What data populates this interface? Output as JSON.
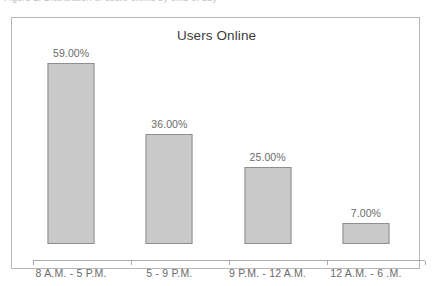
{
  "caption": {
    "text": "Figure 2. Distribution of users online by time of day"
  },
  "chart_data": {
    "type": "bar",
    "title": "Users Online",
    "xlabel": "",
    "ylabel": "",
    "categories": [
      "8 A.M. - 5 P.M.",
      "5 - 9 P.M.",
      "9 P.M. - 12 A.M.",
      "12 A.M. - 6 .M."
    ],
    "values": [
      59.0,
      36.0,
      25.0,
      7.0
    ],
    "value_labels": [
      "59.00%",
      "36.00%",
      "25.00%",
      "7.00%"
    ],
    "unit": "%",
    "ylim": [
      0,
      64
    ],
    "grid": false,
    "legend": "none",
    "series": [
      {
        "name": "Users Online",
        "values": [
          59.0,
          36.0,
          25.0,
          7.0
        ]
      }
    ],
    "style": {
      "bar_fill": "#c9c9c9",
      "bar_border": "#8e8e8e",
      "axis_color": "#a9a9a9",
      "frame_color": "#b6b6b6",
      "title_color": "#3b3b3b",
      "label_color": "#6b6b6b"
    }
  }
}
